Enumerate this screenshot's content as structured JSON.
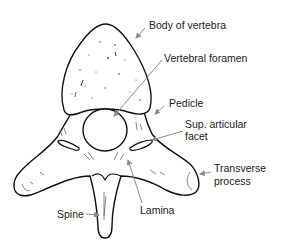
{
  "diagram": {
    "colors": {
      "outline": "#111111",
      "leader": "#8c8c8c",
      "text": "#1a1a1a",
      "background": "#ffffff"
    },
    "labels": {
      "body": "Body of vertebra",
      "foramen": "Vertebral foramen",
      "pedicle": "Pedicle",
      "facet_line1": "Sup. articular",
      "facet_line2": "facet",
      "transverse_line1": "Transverse",
      "transverse_line2": "process",
      "spine": "Spine",
      "lamina": "Lamina"
    }
  }
}
